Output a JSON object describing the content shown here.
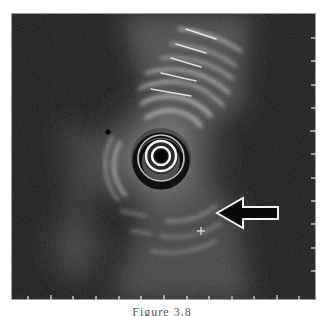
{
  "figure": {
    "type": "endoscopic-ultrasound-image",
    "caption": "Figure 3.8",
    "caption_visible": "partially cut off",
    "annotations": [
      {
        "kind": "arrow",
        "direction": "left",
        "points_to": "lesion",
        "tip": [
          217,
          213
        ],
        "color_fill": "#000000",
        "color_stroke": "#ffffff"
      },
      {
        "kind": "marker",
        "symbol": "+",
        "position": [
          201,
          231
        ]
      }
    ],
    "transducer_center": [
      160,
      155
    ],
    "scale_ticks": {
      "bottom_x": [
        28,
        51,
        73,
        96,
        119,
        141,
        164,
        187,
        209,
        232,
        254,
        277,
        299
      ],
      "right_y": [
        38,
        61,
        85,
        108,
        131,
        154,
        178,
        201,
        224,
        248,
        271
      ]
    },
    "colors": {
      "background": "#1a1a1a",
      "tissue_bright": "#e8e8e8",
      "frame_border": "#9a9a9a",
      "page": "#ffffff"
    }
  }
}
